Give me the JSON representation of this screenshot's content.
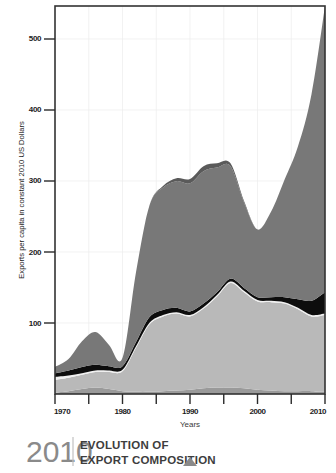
{
  "footer": {
    "year": "2010",
    "title_line1": "EVOLUTION OF",
    "title_line2": "EXPORT COMPOSITION",
    "marker_icon": "triangle-up-icon"
  },
  "chart_data": {
    "type": "area",
    "stacked": true,
    "xlabel": "Years",
    "ylabel": "Exports per capita in constant 2010 US Dollars",
    "xlim": [
      1970,
      2010
    ],
    "ylim": [
      0,
      545
    ],
    "xticks": [
      1970,
      1975,
      1980,
      1985,
      1990,
      1995,
      2000,
      2005,
      2010
    ],
    "xtick_labels": [
      "1970",
      "",
      "1980",
      "",
      "1990",
      "",
      "2000",
      "",
      "2010"
    ],
    "yticks": [
      100,
      200,
      300,
      400,
      500
    ],
    "ytick_labels": [
      "100",
      "200",
      "300",
      "400",
      "500"
    ],
    "grid": true,
    "legend_position": "none",
    "x": [
      1970,
      1972,
      1974,
      1976,
      1978,
      1980,
      1982,
      1984,
      1986,
      1988,
      1990,
      1992,
      1994,
      1996,
      1998,
      2000,
      2002,
      2004,
      2006,
      2008,
      2010
    ],
    "series": [
      {
        "name": "series-1-bottom-medium-gray",
        "color": "#9a9a9a",
        "values": [
          2,
          4,
          7,
          9,
          7,
          4,
          3,
          3,
          4,
          5,
          6,
          8,
          9,
          9,
          8,
          6,
          5,
          4,
          4,
          4,
          3
        ]
      },
      {
        "name": "series-2-light-gray",
        "color": "#b9b9b9",
        "values": [
          18,
          19,
          20,
          22,
          24,
          28,
          62,
          95,
          105,
          108,
          103,
          112,
          128,
          147,
          135,
          124,
          124,
          123,
          115,
          105,
          108
        ]
      },
      {
        "name": "series-3-white-sliver",
        "color": "#f0f0f0",
        "values": [
          4,
          3,
          2,
          2,
          2,
          2,
          2,
          2,
          2,
          2,
          2,
          2,
          2,
          2,
          2,
          2,
          2,
          2,
          2,
          2,
          2
        ]
      },
      {
        "name": "series-4-black",
        "color": "#0d0d0d",
        "values": [
          5,
          7,
          9,
          8,
          6,
          5,
          6,
          8,
          7,
          6,
          5,
          5,
          4,
          4,
          4,
          4,
          5,
          7,
          12,
          20,
          30
        ]
      },
      {
        "name": "series-5-dark-gray",
        "color": "#787878",
        "values": [
          9,
          16,
          36,
          46,
          30,
          12,
          98,
          157,
          172,
          178,
          180,
          186,
          175,
          158,
          120,
          95,
          120,
          165,
          215,
          290,
          402
        ]
      },
      {
        "name": "series-6-top-darkest",
        "color": "#5a5a5a",
        "values": [
          0,
          0,
          0,
          0,
          0,
          0,
          0,
          0,
          2,
          4,
          6,
          7,
          6,
          4,
          2,
          0,
          0,
          0,
          0,
          0,
          0
        ]
      }
    ],
    "totals": [
      38,
      49,
      74,
      87,
      69,
      51,
      171,
      265,
      292,
      303,
      302,
      320,
      324,
      324,
      271,
      231,
      256,
      301,
      348,
      421,
      545
    ]
  }
}
